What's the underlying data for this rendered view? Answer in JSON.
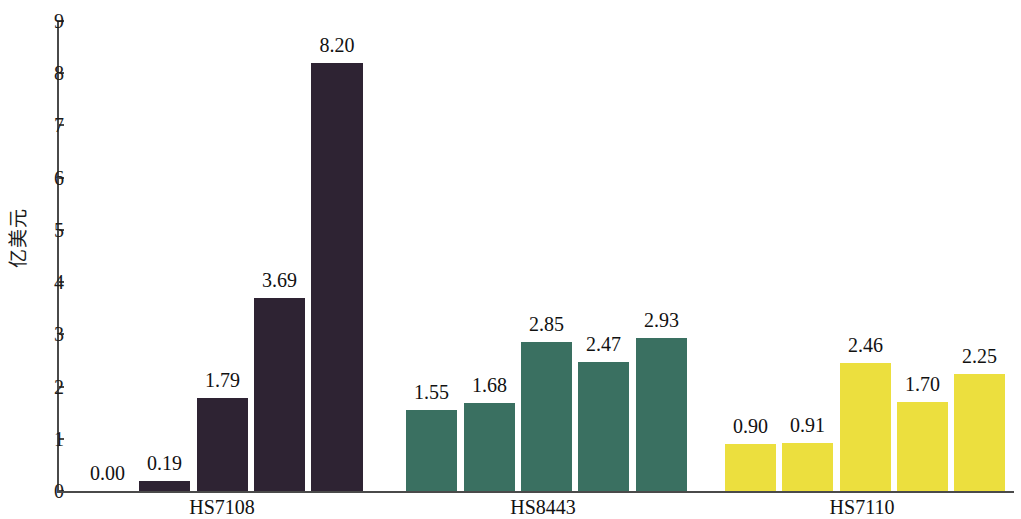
{
  "chart_data": {
    "type": "bar",
    "title": "",
    "subtitle": "",
    "xlabel": "",
    "ylabel": "亿美元",
    "ylim": [
      0,
      9
    ],
    "ytick_labels": [
      "0",
      "1",
      "2",
      "3",
      "4",
      "5",
      "6",
      "7",
      "8",
      "9"
    ],
    "ytick_values": [
      0,
      1,
      2,
      3,
      4,
      5,
      6,
      7,
      8,
      9
    ],
    "grid": false,
    "legend": "none",
    "categories": [
      "HS7108",
      "HS8443",
      "HS7110"
    ],
    "groups": [
      {
        "label": "HS7108",
        "color": "#2e2333",
        "values": [
          0.0,
          0.19,
          1.79,
          3.69,
          8.2
        ],
        "value_labels": [
          "0.00",
          "0.19",
          "1.79",
          "3.69",
          "8.20"
        ]
      },
      {
        "label": "HS8443",
        "color": "#3a7061",
        "values": [
          1.55,
          1.68,
          2.85,
          2.47,
          2.93
        ],
        "value_labels": [
          "1.55",
          "1.68",
          "2.85",
          "2.47",
          "2.93"
        ]
      },
      {
        "label": "HS7110",
        "color": "#ecdf3e",
        "values": [
          0.9,
          0.91,
          2.46,
          1.7,
          2.25
        ],
        "value_labels": [
          "0.90",
          "0.91",
          "2.46",
          "1.70",
          "2.25"
        ]
      }
    ],
    "bar_layout": [
      {
        "group": 0,
        "index": 0,
        "x": 82,
        "w": 51
      },
      {
        "group": 0,
        "index": 1,
        "x": 139,
        "w": 51
      },
      {
        "group": 0,
        "index": 2,
        "x": 197,
        "w": 51
      },
      {
        "group": 0,
        "index": 3,
        "x": 254,
        "w": 51
      },
      {
        "group": 0,
        "index": 4,
        "x": 311,
        "w": 52
      },
      {
        "group": 1,
        "index": 0,
        "x": 406,
        "w": 51
      },
      {
        "group": 1,
        "index": 1,
        "x": 464,
        "w": 51
      },
      {
        "group": 1,
        "index": 2,
        "x": 521,
        "w": 51
      },
      {
        "group": 1,
        "index": 3,
        "x": 578,
        "w": 51
      },
      {
        "group": 1,
        "index": 4,
        "x": 636,
        "w": 51
      },
      {
        "group": 2,
        "index": 0,
        "x": 725,
        "w": 51
      },
      {
        "group": 2,
        "index": 1,
        "x": 782,
        "w": 51
      },
      {
        "group": 2,
        "index": 2,
        "x": 840,
        "w": 51
      },
      {
        "group": 2,
        "index": 3,
        "x": 897,
        "w": 51
      },
      {
        "group": 2,
        "index": 4,
        "x": 954,
        "w": 51
      }
    ],
    "group_label_x": [
      222,
      543,
      862
    ],
    "axis_color": "#4a4a4a",
    "text_color": "#111111",
    "background": "#ffffff"
  }
}
